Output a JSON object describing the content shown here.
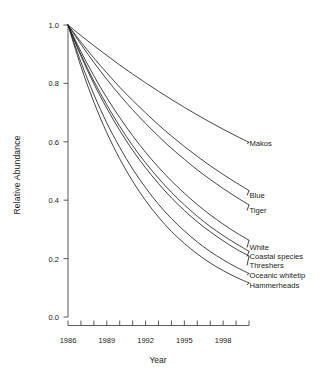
{
  "chart_data": {
    "type": "line",
    "title": "",
    "xlabel": "Year",
    "ylabel": "Relative  Abundance",
    "xlim": [
      1986,
      2000
    ],
    "ylim": [
      0.0,
      1.0
    ],
    "grid": false,
    "legend_position": "right-inline-labels",
    "x_tick_labels": [
      "1986",
      "1989",
      "1992",
      "1995",
      "1998"
    ],
    "x_tick_values": [
      1986,
      1989,
      1992,
      1995,
      1998
    ],
    "x_minor_ticks": [
      1986,
      1987,
      1988,
      1989,
      1990,
      1991,
      1992,
      1993,
      1994,
      1995,
      1996,
      1997,
      1998,
      1999,
      2000
    ],
    "y_tick_labels": [
      "0.0",
      "0.2",
      "0.4",
      "0.6",
      "0.8",
      "1.0"
    ],
    "y_tick_values": [
      0.0,
      0.2,
      0.4,
      0.6,
      0.8,
      1.0
    ],
    "x": [
      1986,
      1987,
      1988,
      1989,
      1990,
      1991,
      1992,
      1993,
      1994,
      1995,
      1996,
      1997,
      1998,
      1999,
      2000
    ],
    "series": [
      {
        "name": "Makos",
        "label": "Makos",
        "color": "#222222",
        "values": [
          1.0,
          0.964,
          0.929,
          0.896,
          0.863,
          0.832,
          0.802,
          0.773,
          0.745,
          0.718,
          0.692,
          0.667,
          0.643,
          0.62,
          0.598
        ]
      },
      {
        "name": "Blue",
        "label": "Blue",
        "color": "#222222",
        "values": [
          1.0,
          0.942,
          0.887,
          0.836,
          0.787,
          0.742,
          0.699,
          0.658,
          0.62,
          0.584,
          0.55,
          0.518,
          0.488,
          0.46,
          0.433
        ]
      },
      {
        "name": "Tiger",
        "label": "Tiger",
        "color": "#222222",
        "values": [
          1.0,
          0.934,
          0.872,
          0.814,
          0.76,
          0.71,
          0.663,
          0.619,
          0.578,
          0.54,
          0.504,
          0.471,
          0.44,
          0.411,
          0.384
        ]
      },
      {
        "name": "White",
        "label": "White",
        "color": "#222222",
        "values": [
          1.0,
          0.909,
          0.826,
          0.751,
          0.683,
          0.621,
          0.564,
          0.513,
          0.466,
          0.424,
          0.385,
          0.35,
          0.318,
          0.289,
          0.263
        ]
      },
      {
        "name": "Coastal species",
        "label": "Coastal species",
        "color": "#222222",
        "values": [
          1.0,
          0.899,
          0.808,
          0.727,
          0.653,
          0.587,
          0.528,
          0.475,
          0.427,
          0.384,
          0.345,
          0.31,
          0.279,
          0.251,
          0.225
        ]
      },
      {
        "name": "Threshers",
        "label": "Threshers",
        "color": "#222222",
        "values": [
          1.0,
          0.894,
          0.799,
          0.715,
          0.639,
          0.571,
          0.511,
          0.457,
          0.408,
          0.365,
          0.326,
          0.292,
          0.261,
          0.233,
          0.209
        ]
      },
      {
        "name": "Oceanic whitetip",
        "label": "Oceanic whitetip",
        "color": "#222222",
        "values": [
          1.0,
          0.873,
          0.762,
          0.665,
          0.581,
          0.507,
          0.443,
          0.386,
          0.337,
          0.295,
          0.257,
          0.224,
          0.196,
          0.171,
          0.149
        ]
      },
      {
        "name": "Hammerheads",
        "label": "Hammerheads",
        "color": "#222222",
        "values": [
          1.0,
          0.858,
          0.736,
          0.631,
          0.542,
          0.465,
          0.399,
          0.342,
          0.293,
          0.252,
          0.216,
          0.185,
          0.159,
          0.136,
          0.117
        ]
      }
    ]
  },
  "labels": {
    "makos": "Makos",
    "blue": "Blue",
    "tiger": "Tiger",
    "white": "White",
    "coastal": "Coastal species",
    "threshers": "Threshers",
    "oceanic": "Oceanic whitetip",
    "hammerheads": "Hammerheads",
    "y_axis_title": "Relative  Abundance",
    "x_axis_title": "Year",
    "y0": "0.0",
    "y1": "0.2",
    "y2": "0.4",
    "y3": "0.6",
    "y4": "0.8",
    "y5": "1.0",
    "x0": "1986",
    "x1": "1989",
    "x2": "1992",
    "x3": "1995",
    "x4": "1998"
  }
}
